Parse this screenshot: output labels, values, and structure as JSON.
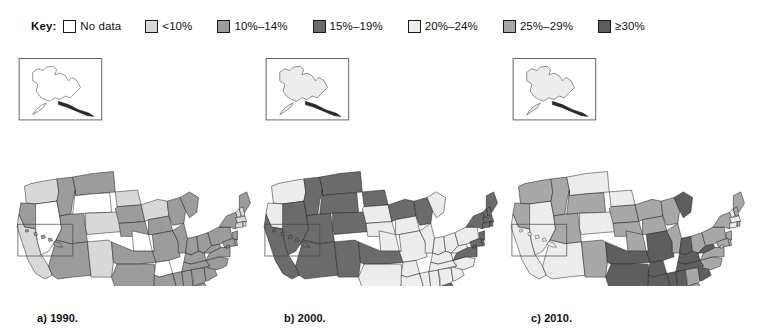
{
  "legend": {
    "title": "Key:",
    "items": [
      {
        "label": "No data",
        "color": "#ffffff"
      },
      {
        "label": "<10%",
        "color": "#d9d9d9"
      },
      {
        "label": "10%–14%",
        "color": "#9c9c9c"
      },
      {
        "label": "15%–19%",
        "color": "#6b6b6b"
      },
      {
        "label": "20%–24%",
        "color": "#ededed"
      },
      {
        "label": "25%–29%",
        "color": "#a8a8a8"
      },
      {
        "label": "≥30%",
        "color": "#5e5e5e"
      }
    ]
  },
  "panels": [
    {
      "caption": "a) 1990.",
      "year": "1990"
    },
    {
      "caption": "b) 2000.",
      "year": "2000"
    },
    {
      "caption": "c) 2010.",
      "year": "2010"
    }
  ],
  "chart_data": {
    "type": "heatmap",
    "title": "",
    "subtitle": "",
    "legend_position": "top-left",
    "map": "united-states-choropleth",
    "panel_count": 3,
    "categories": [
      "No data",
      "<10%",
      "10%–14%",
      "15%–19%",
      "20%–24%",
      "25%–29%",
      "≥30%"
    ],
    "category_colors": [
      "#ffffff",
      "#d9d9d9",
      "#9c9c9c",
      "#6b6b6b",
      "#ededed",
      "#a8a8a8",
      "#5e5e5e"
    ],
    "series": [
      {
        "name": "1990",
        "values": {
          "AL": "10%–14%",
          "AK": "No data",
          "AZ": "10%–14%",
          "AR": "No data",
          "CA": "<10%",
          "CO": "<10%",
          "CT": "<10%",
          "DE": "10%–14%",
          "DC": "10%–14%",
          "FL": "10%–14%",
          "GA": "10%–14%",
          "HI": "10%–14%",
          "ID": "10%–14%",
          "IL": "10%–14%",
          "IN": "10%–14%",
          "IA": "10%–14%",
          "KS": "No data",
          "KY": "10%–14%",
          "LA": "10%–14%",
          "ME": "10%–14%",
          "MD": "10%–14%",
          "MA": "<10%",
          "MI": "10%–14%",
          "MN": "<10%",
          "MS": "10%–14%",
          "MO": "10%–14%",
          "MT": "10%–14%",
          "NE": "10%–14%",
          "NV": "No data",
          "NH": "<10%",
          "NJ": "10%–14%",
          "NM": "<10%",
          "NY": "10%–14%",
          "NC": "10%–14%",
          "ND": "<10%",
          "OH": "10%–14%",
          "OK": "10%–14%",
          "OR": "10%–14%",
          "PA": "10%–14%",
          "RI": "<10%",
          "SC": "10%–14%",
          "SD": "10%–14%",
          "TN": "10%–14%",
          "TX": "10%–14%",
          "UT": "10%–14%",
          "VT": "<10%",
          "VA": "10%–14%",
          "WA": "<10%",
          "WV": "10%–14%",
          "WI": "10%–14%",
          "WY": "No data"
        }
      },
      {
        "name": "2000",
        "values": {
          "AL": "20%–24%",
          "AK": "20%–24%",
          "AZ": "15%–19%",
          "AR": "20%–24%",
          "CA": "15%–19%",
          "CO": "15%–19%",
          "CT": "15%–19%",
          "DE": "15%–19%",
          "DC": "15%–19%",
          "FL": "15%–19%",
          "GA": "20%–24%",
          "HI": "15%–19%",
          "ID": "15%–19%",
          "IL": "20%–24%",
          "IN": "20%–24%",
          "IA": "20%–24%",
          "KS": "20%–24%",
          "KY": "20%–24%",
          "LA": "20%–24%",
          "ME": "15%–19%",
          "MD": "15%–19%",
          "MA": "15%–19%",
          "MI": "20%–24%",
          "MN": "15%–19%",
          "MS": "20%–24%",
          "MO": "20%–24%",
          "MT": "15%–19%",
          "NE": "20%–24%",
          "NV": "15%–19%",
          "NH": "15%–19%",
          "NJ": "15%–19%",
          "NM": "15%–19%",
          "NY": "15%–19%",
          "NC": "20%–24%",
          "ND": "15%–19%",
          "OH": "20%–24%",
          "OK": "15%–19%",
          "OR": "20%–24%",
          "PA": "20%–24%",
          "RI": "15%–19%",
          "SC": "20%–24%",
          "SD": "20%–24%",
          "TN": "20%–24%",
          "TX": "20%–24%",
          "UT": "15%–19%",
          "VT": "15%–19%",
          "VA": "15%–19%",
          "WA": "20%–24%",
          "WV": "20%–24%",
          "WI": "15%–19%",
          "WY": "15%–19%"
        }
      },
      {
        "name": "2010",
        "values": {
          "AL": "≥30%",
          "AK": "20%–24%",
          "AZ": "20%–24%",
          "AR": "≥30%",
          "CA": "20%–24%",
          "CO": "20%–24%",
          "CT": "20%–24%",
          "DC": "20%–24%",
          "DE": "25%–29%",
          "FL": "25%–29%",
          "GA": "25%–29%",
          "HI": "20%–24%",
          "ID": "25%–29%",
          "IL": "25%–29%",
          "IN": "≥30%",
          "IA": "25%–29%",
          "KS": "25%–29%",
          "KY": "≥30%",
          "LA": "≥30%",
          "ME": "25%–29%",
          "MD": "25%–29%",
          "MA": "20%–24%",
          "MI": "≥30%",
          "MN": "25%–29%",
          "MS": "≥30%",
          "MO": "≥30%",
          "MT": "20%–24%",
          "NE": "25%–29%",
          "NV": "20%–24%",
          "NH": "25%–29%",
          "NJ": "25%–29%",
          "NM": "25%–29%",
          "NY": "25%–29%",
          "NC": "25%–29%",
          "ND": "20%–24%",
          "OH": "25%–29%",
          "OK": "≥30%",
          "OR": "25%–29%",
          "PA": "25%–29%",
          "RI": "25%–29%",
          "SC": "≥30%",
          "SD": "25%–29%",
          "TN": "≥30%",
          "TX": "≥30%",
          "UT": "25%–29%",
          "VT": "20%–24%",
          "VA": "25%–29%",
          "WA": "25%–29%",
          "WV": "≥30%",
          "WI": "25%–29%",
          "WY": "25%–29%"
        }
      }
    ]
  }
}
